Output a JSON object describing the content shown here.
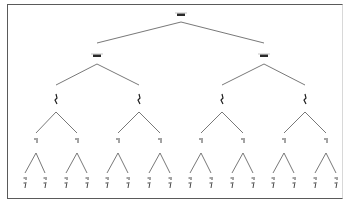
{
  "diagram": {
    "type": "binary-tree",
    "levels": 5,
    "colors": {
      "edge": "#555555",
      "frame": "#5a5a5a",
      "node": "#222222",
      "background": "#ffffff"
    },
    "nodes": [
      {
        "id": "n0",
        "level": 0,
        "x": 181,
        "y": 15,
        "label": ""
      },
      {
        "id": "n1",
        "level": 1,
        "x": 97,
        "y": 56,
        "label": ""
      },
      {
        "id": "n2",
        "level": 1,
        "x": 264,
        "y": 56,
        "label": ""
      },
      {
        "id": "n3",
        "level": 2,
        "x": 56,
        "y": 99,
        "label": ""
      },
      {
        "id": "n4",
        "level": 2,
        "x": 139,
        "y": 99,
        "label": ""
      },
      {
        "id": "n5",
        "level": 2,
        "x": 222,
        "y": 99,
        "label": ""
      },
      {
        "id": "n6",
        "level": 2,
        "x": 305,
        "y": 99,
        "label": ""
      },
      {
        "id": "n7",
        "level": 3,
        "x": 36,
        "y": 140,
        "label": ""
      },
      {
        "id": "n8",
        "level": 3,
        "x": 77,
        "y": 140,
        "label": ""
      },
      {
        "id": "n9",
        "level": 3,
        "x": 118,
        "y": 140,
        "label": ""
      },
      {
        "id": "n10",
        "level": 3,
        "x": 160,
        "y": 140,
        "label": ""
      },
      {
        "id": "n11",
        "level": 3,
        "x": 201,
        "y": 140,
        "label": ""
      },
      {
        "id": "n12",
        "level": 3,
        "x": 243,
        "y": 140,
        "label": ""
      },
      {
        "id": "n13",
        "level": 3,
        "x": 284,
        "y": 140,
        "label": ""
      },
      {
        "id": "n14",
        "level": 3,
        "x": 326,
        "y": 140,
        "label": ""
      }
    ],
    "leaves_x": [
      25,
      45,
      66,
      87,
      107,
      128,
      149,
      170,
      190,
      211,
      232,
      253,
      273,
      294,
      315,
      336
    ],
    "leaves_y": 183,
    "label_note": "node labels are illegible at this resolution"
  }
}
